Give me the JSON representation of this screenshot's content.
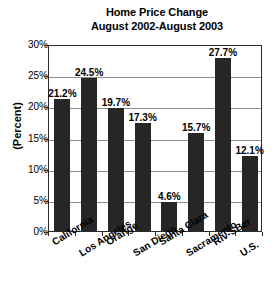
{
  "chart_data": {
    "type": "bar",
    "title": "Home Price Change August 2002-August 2003",
    "title_line1": "Home Price Change",
    "title_line2": "August 2002-August 2003",
    "xlabel": "",
    "ylabel": "(Percent)",
    "ylim": [
      0,
      30
    ],
    "ytick_step": 5,
    "grid": true,
    "legend": "none",
    "bar_color": "#262626",
    "categories": [
      "California",
      "Los Angeles",
      "Orange",
      "San Diego",
      "Santa Clara",
      "Sacramento",
      "Riv-SBer",
      "U.S."
    ],
    "values": [
      21.2,
      24.5,
      19.7,
      17.3,
      4.6,
      15.7,
      27.7,
      12.1
    ],
    "value_labels": [
      "21.2%",
      "24.5%",
      "19.7%",
      "17.3%",
      "4.6%",
      "15.7%",
      "27.7%",
      "12.1%"
    ],
    "ytick_labels": [
      "0%",
      "5%",
      "10%",
      "15%",
      "20%",
      "25%",
      "30%"
    ],
    "ytick_values": [
      0,
      5,
      10,
      15,
      20,
      25,
      30
    ]
  }
}
